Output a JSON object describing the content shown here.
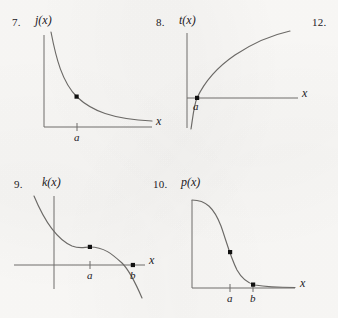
{
  "page": {
    "background_color": "#fbfaf8",
    "ink_color": "#22201e",
    "curve_color": "#6b6966",
    "axis_color": "#6f6d6a",
    "point_color": "#111111",
    "width": 338,
    "height": 318
  },
  "stray_numbers": [
    {
      "text": "12."
    }
  ],
  "figures": [
    {
      "number": "7.",
      "function_label": "j(x)",
      "x_axis_label": "x",
      "tick_labels": [
        "a"
      ],
      "description": "decreasing convex curve approaching horizontal asymptote, one marked point above a",
      "points": [
        {
          "label": "a",
          "on_axis": false
        }
      ]
    },
    {
      "number": "8.",
      "function_label": "t(x)",
      "x_axis_label": "x",
      "tick_labels": [
        "a"
      ],
      "description": "increasing concave-down logarithmic curve crossing x-axis at a",
      "points": [
        {
          "label": "a",
          "on_axis": true
        }
      ]
    },
    {
      "number": "9.",
      "function_label": "k(x)",
      "x_axis_label": "x",
      "tick_labels": [
        "a",
        "b"
      ],
      "description": "decreasing curve with flat inflection plateau at a, crossing x-axis at b",
      "points": [
        {
          "label": "a",
          "on_axis": false
        },
        {
          "label": "b",
          "on_axis": true
        }
      ]
    },
    {
      "number": "10.",
      "function_label": "p(x)",
      "x_axis_label": "x",
      "tick_labels": [
        "a",
        "b"
      ],
      "description": "sigmoid decay curve from high plateau down to horizontal asymptote, points at a and b",
      "points": [
        {
          "label": "a",
          "on_axis": false
        },
        {
          "label": "b",
          "on_axis": false
        }
      ]
    }
  ]
}
